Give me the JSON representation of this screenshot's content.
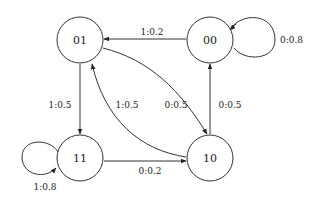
{
  "diagram": {
    "type": "state-transition",
    "nodes": [
      {
        "id": "01",
        "label": "01"
      },
      {
        "id": "00",
        "label": "00"
      },
      {
        "id": "11",
        "label": "11"
      },
      {
        "id": "10",
        "label": "10"
      }
    ],
    "edges": [
      {
        "from": "00",
        "to": "01",
        "label": "1:0.2"
      },
      {
        "from": "00",
        "to": "00",
        "label": "0:0.8"
      },
      {
        "from": "01",
        "to": "11",
        "label": "1:0.5"
      },
      {
        "from": "01",
        "to": "10",
        "label": "0:0.5"
      },
      {
        "from": "10",
        "to": "01",
        "label": "1:0.5"
      },
      {
        "from": "10",
        "to": "00",
        "label": "0:0.5"
      },
      {
        "from": "11",
        "to": "10",
        "label": "0:0.2"
      },
      {
        "from": "11",
        "to": "11",
        "label": "1:0.8"
      }
    ]
  }
}
